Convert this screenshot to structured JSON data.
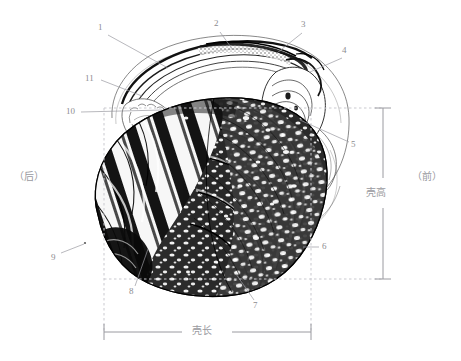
{
  "figure": {
    "background_color": "#ffffff",
    "ink_color": "#1a1a1a",
    "label_color": "#8c8c90",
    "guide_color": "#c9c9cf",
    "width": 461,
    "height": 361
  },
  "callouts": [
    {
      "id": "1",
      "label": "1",
      "x": 102,
      "y": 27,
      "line": [
        [
          108,
          35
        ],
        [
          168,
          68
        ]
      ]
    },
    {
      "id": "2",
      "label": "2",
      "x": 217,
      "y": 23,
      "line": [
        [
          220,
          32
        ],
        [
          233,
          50
        ]
      ]
    },
    {
      "id": "3",
      "label": "3",
      "x": 304,
      "y": 24,
      "line": [
        [
          302,
          33
        ],
        [
          277,
          53
        ]
      ]
    },
    {
      "id": "4",
      "label": "4",
      "x": 345,
      "y": 50,
      "line": [
        [
          342,
          58
        ],
        [
          310,
          72
        ]
      ]
    },
    {
      "id": "5",
      "label": "5",
      "x": 352,
      "y": 144,
      "line": [
        [
          350,
          142
        ],
        [
          300,
          120
        ]
      ]
    },
    {
      "id": "6",
      "label": "6",
      "x": 322,
      "y": 245,
      "line": [
        [
          320,
          249
        ],
        [
          305,
          249
        ]
      ]
    },
    {
      "id": "7",
      "label": "7",
      "x": 257,
      "y": 305,
      "line": [
        [
          255,
          301
        ],
        [
          237,
          277
        ]
      ]
    },
    {
      "id": "8",
      "label": "8",
      "x": 132,
      "y": 291,
      "line": [
        [
          134,
          287
        ],
        [
          147,
          250
        ]
      ]
    },
    {
      "id": "9",
      "label": "9",
      "x": 54,
      "y": 257,
      "line": [
        [
          60,
          253
        ],
        [
          82,
          245
        ]
      ]
    },
    {
      "id": "10",
      "label": "10",
      "x": 68,
      "y": 111,
      "line": [
        [
          80,
          113
        ],
        [
          160,
          110
        ]
      ]
    },
    {
      "id": "11",
      "label": "11",
      "x": 88,
      "y": 76,
      "line": [
        [
          100,
          80
        ],
        [
          140,
          95
        ]
      ]
    }
  ],
  "annotations": {
    "posterior": "（后）",
    "anterior": "（前）",
    "shell_height": "壳高",
    "shell_length": "壳长"
  },
  "annotation_positions": {
    "posterior": {
      "x": 14,
      "y": 178
    },
    "anterior": {
      "x": 415,
      "y": 178
    },
    "shell_height": {
      "x": 366,
      "y": 193
    },
    "shell_length": {
      "x": 205,
      "y": 327
    }
  },
  "measure_guides": {
    "dashed_top_y": 108,
    "dashed_bottom_y": 279,
    "dashed_left_x": 104,
    "dashed_right_x": 311,
    "height_bracket_x": 383,
    "height_top_y": 108,
    "height_bottom_y": 279,
    "length_bracket_y": 332,
    "length_left_x": 104,
    "length_right_x": 311
  }
}
